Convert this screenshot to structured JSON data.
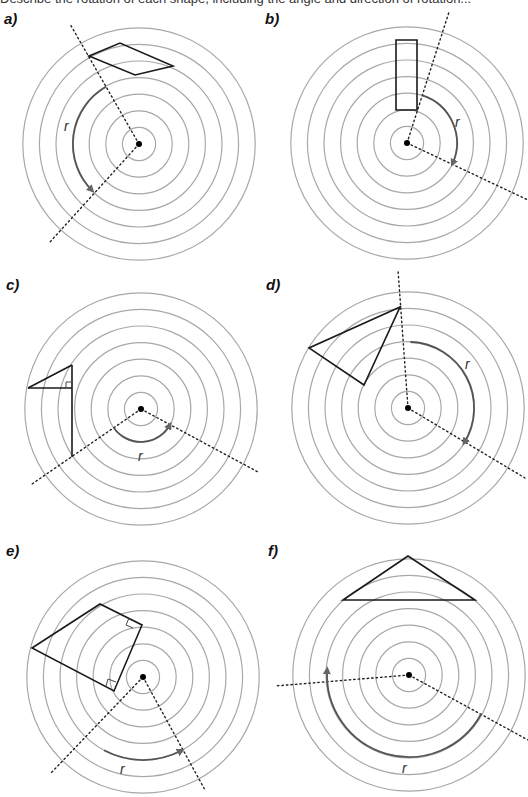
{
  "header": {
    "cut_text": "Describe the rotation of each shape, including the angle and direction of rotation..."
  },
  "style": {
    "ring_color": "#a8a8a8",
    "shape_color": "#1a1a1a",
    "arc_color": "#555555",
    "dot_color": "#000000"
  },
  "panels": [
    {
      "label": "a)",
      "label_pos": [
        4,
        10
      ],
      "center": [
        139,
        144
      ],
      "rays": [
        [
          70,
          24
        ],
        [
          50,
          242
        ]
      ],
      "shape": [
        [
          89,
          56
        ],
        [
          120,
          43
        ],
        [
          173,
          66
        ],
        [
          135,
          75
        ]
      ],
      "shape_closed": true,
      "arc": {
        "radius": 66,
        "from_deg": 240,
        "to_deg": 135,
        "sweep": 0
      },
      "r_label": "r",
      "r_pos": [
        64,
        131
      ]
    },
    {
      "label": "b)",
      "label_pos": [
        265,
        10
      ],
      "center": [
        407,
        143
      ],
      "rays": [
        [
          449,
          12
        ],
        [
          528,
          200
        ]
      ],
      "shape": [
        [
          396,
          40
        ],
        [
          417,
          40
        ],
        [
          417,
          110
        ],
        [
          396,
          110
        ]
      ],
      "shape_closed": true,
      "arc": {
        "radius": 50,
        "from_deg": 288,
        "to_deg": 25,
        "sweep": 1
      },
      "r_label": "r",
      "r_pos": [
        455,
        127
      ]
    },
    {
      "label": "c)",
      "label_pos": [
        6,
        276
      ],
      "center": [
        141,
        409
      ],
      "rays": [
        [
          32,
          484
        ],
        [
          258,
          472
        ]
      ],
      "shape_lines": [
        [
          [
            28,
            388
          ],
          [
            72,
            365
          ]
        ],
        [
          [
            28,
            388
          ],
          [
            72,
            388
          ]
        ],
        [
          [
            72,
            365
          ],
          [
            72,
            457
          ]
        ]
      ],
      "right_angles": [
        [
          72,
          388,
          -1,
          -1
        ]
      ],
      "arc": {
        "radius": 33,
        "from_deg": 145,
        "to_deg": 28,
        "sweep": 0
      },
      "r_label": "r",
      "r_pos": [
        138,
        461
      ]
    },
    {
      "label": "d)",
      "label_pos": [
        266,
        276
      ],
      "center": [
        408,
        408
      ],
      "rays": [
        [
          398,
          270
        ],
        [
          525,
          478
        ]
      ],
      "shape": [
        [
          400,
          307
        ],
        [
          309,
          348
        ],
        [
          364,
          385
        ]
      ],
      "shape_closed": true,
      "arc": {
        "radius": 66,
        "from_deg": 272,
        "to_deg": 32,
        "sweep": 1
      },
      "r_label": "r",
      "r_pos": [
        465,
        369
      ]
    },
    {
      "label": "e)",
      "label_pos": [
        6,
        542
      ],
      "center": [
        143,
        677
      ],
      "rays": [
        [
          50,
          774
        ],
        [
          205,
          790
        ]
      ],
      "shape": [
        [
          32,
          648
        ],
        [
          100,
          604
        ],
        [
          142,
          625
        ],
        [
          114,
          691
        ]
      ],
      "shape_closed": true,
      "right_angles_e": true,
      "arc": {
        "radius": 83,
        "from_deg": 118,
        "to_deg": 62,
        "sweep": 0
      },
      "r_label": "r",
      "r_pos": [
        120,
        774
      ]
    },
    {
      "label": "f)",
      "label_pos": [
        268,
        542
      ],
      "center": [
        409,
        675
      ],
      "rays": [
        [
          275,
          686
        ],
        [
          528,
          740
        ]
      ],
      "shape": [
        [
          408,
          556
        ],
        [
          343,
          600
        ],
        [
          475,
          600
        ]
      ],
      "shape_closed": true,
      "arc": {
        "radius": 82,
        "from_deg": 28,
        "to_deg": 184,
        "sweep": 1
      },
      "r_label": "r",
      "r_pos": [
        402,
        773
      ]
    }
  ],
  "rings": {
    "count": 7,
    "spacing": 16.6
  }
}
